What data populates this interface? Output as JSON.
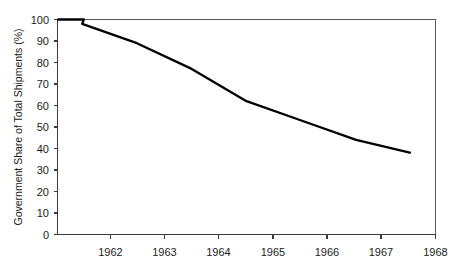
{
  "chart_data": {
    "type": "line",
    "title": "",
    "subtitle": "",
    "xlabel": "",
    "ylabel": "Government Share of Total Shipments (%)",
    "x": [
      1962,
      1963,
      1964,
      1965,
      1966,
      1967,
      1968
    ],
    "categories": [
      "1962",
      "1963",
      "1964",
      "1965",
      "1966",
      "1967",
      "1968"
    ],
    "series": [
      {
        "name": "Government Share of Total Shipments",
        "values": [
          98,
          89,
          77,
          62,
          53,
          44,
          38
        ]
      }
    ],
    "extra_points": [
      {
        "x": 1961.55,
        "y": 100
      }
    ],
    "xlim": [
      1961.55,
      1968.45
    ],
    "ylim": [
      0,
      100
    ],
    "ytick_values": [
      0,
      10,
      20,
      30,
      40,
      50,
      60,
      70,
      80,
      90,
      100
    ],
    "ytick_labels": [
      "0",
      "10",
      "20",
      "30",
      "40",
      "50",
      "60",
      "70",
      "80",
      "90",
      "100"
    ],
    "xtick_labels": [
      "1962",
      "1963",
      "1964",
      "1965",
      "1966",
      "1967",
      "1968"
    ],
    "grid": false,
    "legend": false,
    "legend_position": "none",
    "line_color": "#000000",
    "axis_color": "#3b3b3b",
    "background_color": "#ffffff"
  },
  "axes": {
    "y_axis_title": "Government Share of Total Shipments (%)"
  }
}
